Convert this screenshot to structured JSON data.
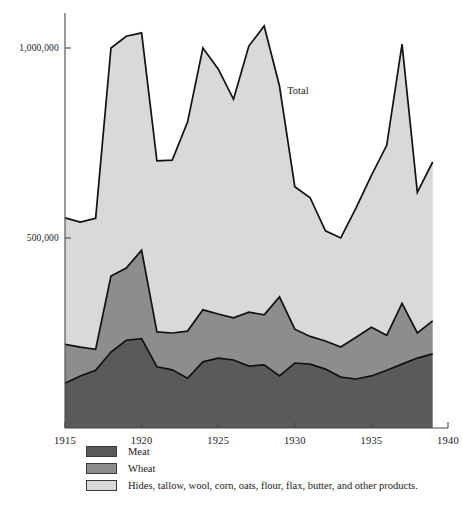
{
  "chart_data": {
    "type": "area",
    "title": "",
    "subtitle": "",
    "xlabel": "",
    "ylabel": "",
    "stacked": true,
    "grid": false,
    "legend_position": "below-left",
    "xlim": [
      1915,
      1940
    ],
    "ylim": [
      0,
      1100000
    ],
    "xticks": [
      1915,
      1920,
      1925,
      1930,
      1935,
      1940
    ],
    "xtick_labels": [
      "1915",
      "1920",
      "1925",
      "1930",
      "1935",
      "1940"
    ],
    "yticks": [
      500000,
      1000000
    ],
    "ytick_labels": [
      "500,000",
      "1,000,000"
    ],
    "x": [
      1915,
      1916,
      1917,
      1918,
      1919,
      1920,
      1921,
      1922,
      1923,
      1924,
      1925,
      1926,
      1927,
      1928,
      1929,
      1930,
      1931,
      1932,
      1933,
      1934,
      1935,
      1936,
      1937,
      1938,
      1939
    ],
    "series": [
      {
        "name": "Meat",
        "color": "#5a5a5a",
        "values": [
          118000,
          137000,
          152000,
          200000,
          231000,
          235000,
          161000,
          153000,
          131000,
          174000,
          184000,
          179000,
          163000,
          166000,
          137000,
          171000,
          168000,
          155000,
          134000,
          129000,
          137000,
          152000,
          168000,
          184000,
          195000
        ]
      },
      {
        "name": "Wheat",
        "color": "#8d8d8d",
        "values": [
          102000,
          76000,
          55000,
          200000,
          190000,
          233000,
          92000,
          97000,
          124000,
          137000,
          116000,
          111000,
          142000,
          132000,
          208000,
          89000,
          73000,
          74000,
          79000,
          110000,
          128000,
          92000,
          160000,
          66000,
          87000
        ]
      },
      {
        "name": "Hides, tallow, wool, corn, oats, flour, flax, butter, and other products.",
        "color": "#d9d9d9",
        "values": [
          333000,
          329000,
          345000,
          600000,
          610000,
          572000,
          450000,
          455000,
          550000,
          689000,
          645000,
          575000,
          700000,
          760000,
          555000,
          375000,
          365000,
          290000,
          287000,
          340000,
          400000,
          500000,
          682000,
          370000,
          418000
        ]
      }
    ],
    "totals": [
      553000,
      542000,
      552000,
      1000000,
      1031000,
      1040000,
      703000,
      705000,
      805000,
      1000000,
      945000,
      865000,
      1005000,
      1058000,
      900000,
      635000,
      606000,
      519000,
      500000,
      579000,
      665000,
      744000,
      1010000,
      620000,
      700000
    ],
    "annotations": [
      {
        "name": "total-label",
        "text": "Total",
        "x": 1929.5,
        "y": 880000
      }
    ],
    "legend_entries": [
      {
        "label": "Meat",
        "color": "#5a5a5a"
      },
      {
        "label": "Wheat",
        "color": "#8d8d8d"
      },
      {
        "label": "Hides, tallow, wool, corn, oats, flour, flax, butter, and other products.",
        "color": "#d9d9d9"
      }
    ]
  },
  "colors": {
    "meat": "#5a5a5a",
    "wheat": "#8d8d8d",
    "other": "#d9d9d9",
    "axis": "#4a4a4a",
    "outline": "#111111",
    "background": "#ffffff"
  }
}
